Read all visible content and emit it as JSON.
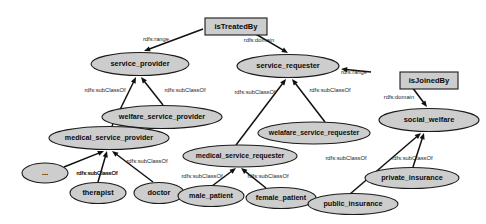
{
  "diagram": {
    "type": "rdfs-class-diagram",
    "canvas": {
      "width": 486,
      "height": 224
    },
    "colors": {
      "node_fill": "#cdcdcd",
      "node_stroke": "#1a1a1a",
      "edge_stroke": "#111111",
      "label_text": "#0b0b0b",
      "background": "#ffffff"
    },
    "property_nodes": [
      {
        "id": "isTreatedBy",
        "label": "isTreatedBy",
        "shape": "rectangle",
        "x": 205,
        "y": 18,
        "w": 62,
        "h": 17,
        "font_size": 7.6
      },
      {
        "id": "isJoinedBy",
        "label": "isJoinedBy",
        "shape": "rectangle",
        "x": 400,
        "y": 72,
        "w": 58,
        "h": 17,
        "font_size": 7.6
      }
    ],
    "class_nodes": [
      {
        "id": "service_provider",
        "label": "service_provider",
        "shape": "ellipse",
        "cx": 140,
        "cy": 64,
        "rx": 49,
        "ry": 11.5,
        "font_size": 7.4
      },
      {
        "id": "service_requester",
        "label": "service_requester",
        "shape": "ellipse",
        "cx": 288,
        "cy": 66,
        "rx": 51,
        "ry": 11.5,
        "font_size": 7.4
      },
      {
        "id": "welfare_service_provider",
        "label": "welfare_service_provider",
        "shape": "ellipse",
        "cx": 162,
        "cy": 117,
        "rx": 60,
        "ry": 11.5,
        "font_size": 7.2
      },
      {
        "id": "medical_service_provider",
        "label": "medical_service_provider",
        "shape": "ellipse",
        "cx": 109,
        "cy": 138,
        "rx": 60,
        "ry": 11.5,
        "font_size": 7.2
      },
      {
        "id": "welafare_service_requester",
        "label": "welafare_service_requester",
        "shape": "ellipse",
        "cx": 314,
        "cy": 133,
        "rx": 56,
        "ry": 11,
        "font_size": 6.9
      },
      {
        "id": "medical_service_requester",
        "label": "medical_service_requester",
        "shape": "ellipse",
        "cx": 240,
        "cy": 156,
        "rx": 57,
        "ry": 11,
        "font_size": 6.9
      },
      {
        "id": "social_welfare",
        "label": "social_welfare",
        "shape": "ellipse",
        "cx": 429,
        "cy": 120,
        "rx": 50,
        "ry": 11.5,
        "font_size": 7.4
      },
      {
        "id": "ellipsis",
        "label": "...",
        "shape": "ellipse",
        "cx": 45,
        "cy": 173,
        "rx": 23,
        "ry": 10,
        "font_size": 7.4
      },
      {
        "id": "therapist",
        "label": "therapist",
        "shape": "ellipse",
        "cx": 98,
        "cy": 193,
        "rx": 28,
        "ry": 10.5,
        "font_size": 7.4
      },
      {
        "id": "doctor",
        "label": "doctor",
        "shape": "ellipse",
        "cx": 159,
        "cy": 193,
        "rx": 25,
        "ry": 10.5,
        "font_size": 7.4
      },
      {
        "id": "male_patient",
        "label": "male_patient",
        "shape": "ellipse",
        "cx": 211,
        "cy": 196,
        "rx": 33,
        "ry": 10.5,
        "font_size": 7.2
      },
      {
        "id": "female_patient",
        "label": "female_patient",
        "shape": "ellipse",
        "cx": 281,
        "cy": 198,
        "rx": 35,
        "ry": 10.5,
        "font_size": 7.2
      },
      {
        "id": "private_insurance",
        "label": "private_insurance",
        "shape": "ellipse",
        "cx": 412,
        "cy": 178,
        "rx": 47,
        "ry": 10.5,
        "font_size": 7.2
      },
      {
        "id": "public_insurance",
        "label": "public_insurance",
        "shape": "ellipse",
        "cx": 353,
        "cy": 204,
        "rx": 45,
        "ry": 10.5,
        "font_size": 7.2
      }
    ],
    "edges": [
      {
        "id": "edge-istreatedby-range-service-provider",
        "from": "isTreatedBy",
        "to": "service_provider",
        "label": "rdfs:range",
        "x1": 203,
        "y1": 29,
        "x2": 144,
        "y2": 51,
        "lx": 156,
        "ly": 39,
        "font_size": 5.8
      },
      {
        "id": "edge-istreatedby-domain-service-requester",
        "from": "isTreatedBy",
        "to": "service_requester",
        "label": "rdfs:domain",
        "x1": 247,
        "y1": 29,
        "x2": 288,
        "y2": 53,
        "lx": 259,
        "ly": 40,
        "font_size": 5.8
      },
      {
        "id": "edge-isjoinedby-range-service-requester",
        "from": "isJoinedBy",
        "to": "service_requester",
        "label": "rdfs:range",
        "x1": 371,
        "y1": 72,
        "x2": 341,
        "y2": 69,
        "lx": 354,
        "ly": 72,
        "font_size": 5.8
      },
      {
        "id": "edge-isjoinedby-domain-social-welfare",
        "from": "isJoinedBy",
        "to": "social_welfare",
        "label": "rdfs:domain",
        "x1": 409,
        "y1": 83,
        "x2": 427,
        "y2": 107,
        "lx": 399,
        "ly": 97,
        "font_size": 5.8
      },
      {
        "id": "edge-medical-provider-sub-service-provider",
        "from": "medical_service_provider",
        "to": "service_provider",
        "label": "rdfs:subClassOf",
        "x1": 112,
        "y1": 126,
        "x2": 136,
        "y2": 77,
        "lx": 105,
        "ly": 90,
        "font_size": 5.8
      },
      {
        "id": "edge-welfare-provider-sub-service-provider",
        "from": "welfare_service_provider",
        "to": "service_provider",
        "label": "rdfs:subClassOf",
        "x1": 163,
        "y1": 105,
        "x2": 141,
        "y2": 77,
        "lx": 185,
        "ly": 90,
        "font_size": 5.8
      },
      {
        "id": "edge-medical-requester-sub-service-requester",
        "from": "medical_service_requester",
        "to": "service_requester",
        "label": "rdfs:subClassOf",
        "x1": 236,
        "y1": 145,
        "x2": 286,
        "y2": 79,
        "lx": 255,
        "ly": 92,
        "font_size": 5.8
      },
      {
        "id": "edge-welafare-requester-sub-service-requester",
        "from": "welafare_service_requester",
        "to": "service_requester",
        "label": "rdfs:subClassOf",
        "x1": 325,
        "y1": 122,
        "x2": 292,
        "y2": 79,
        "lx": 330,
        "ly": 90,
        "font_size": 5.8
      },
      {
        "id": "edge-ellipsis-sub-medical-provider",
        "from": "ellipsis",
        "to": "medical_service_provider",
        "label": "rdfs:subClassOf",
        "x1": 64,
        "y1": 167,
        "x2": 104,
        "y2": 151,
        "lx": 97,
        "ly": 173,
        "font_size": 5.8
      },
      {
        "id": "edge-therapist-sub-medical-provider",
        "from": "therapist",
        "to": "medical_service_provider",
        "label": "rdfs:subClassOf",
        "x1": 98,
        "y1": 182,
        "x2": 107,
        "y2": 151,
        "lx": 97,
        "ly": 173,
        "font_size": 5.8
      },
      {
        "id": "edge-doctor-sub-medical-provider",
        "from": "doctor",
        "to": "medical_service_provider",
        "label": "rdfs:subClassOf",
        "x1": 153,
        "y1": 182,
        "x2": 112,
        "y2": 151,
        "lx": 147,
        "ly": 161,
        "font_size": 5.8
      },
      {
        "id": "edge-male-patient-sub-medical-requester",
        "from": "male_patient",
        "to": "medical_service_requester",
        "label": "rdfs:subClassOf",
        "x1": 212,
        "y1": 186,
        "x2": 236,
        "y2": 168,
        "lx": 202,
        "ly": 176,
        "font_size": 5.8
      },
      {
        "id": "edge-female-patient-sub-medical-requester",
        "from": "female_patient",
        "to": "medical_service_requester",
        "label": "rdfs:subClassOf",
        "x1": 266,
        "y1": 188,
        "x2": 241,
        "y2": 168,
        "lx": 268,
        "ly": 176,
        "font_size": 5.8
      },
      {
        "id": "edge-private-insurance-sub-social-welfare",
        "from": "private_insurance",
        "to": "social_welfare",
        "label": "rdfs:subClassOf",
        "x1": 413,
        "y1": 167,
        "x2": 424,
        "y2": 133,
        "lx": 412,
        "ly": 158,
        "font_size": 5.8
      },
      {
        "id": "edge-public-insurance-sub-social-welfare",
        "from": "public_insurance",
        "to": "social_welfare",
        "label": "rdfs:subClassOf",
        "x1": 350,
        "y1": 194,
        "x2": 421,
        "y2": 133,
        "lx": 346,
        "ly": 158,
        "font_size": 5.8
      }
    ]
  }
}
